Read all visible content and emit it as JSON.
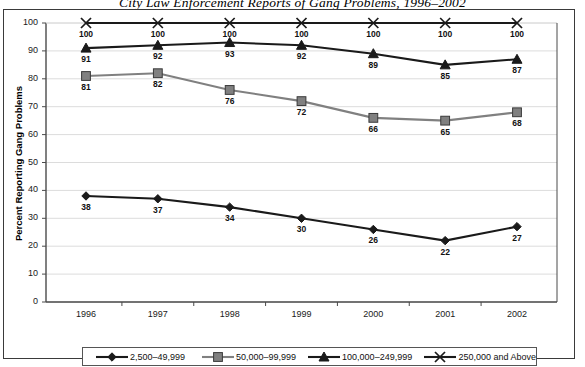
{
  "chart_data": {
    "type": "line",
    "title": "City Law Enforcement Reports of Gang Problems, 1996–2002",
    "xlabel": "",
    "ylabel": "Percent Reporting Gang Problems",
    "categories": [
      "1996",
      "1997",
      "1998",
      "1999",
      "2000",
      "2001",
      "2002"
    ],
    "ylim": [
      0,
      100
    ],
    "ytick_labels": [
      "0",
      "10",
      "20",
      "30",
      "40",
      "50",
      "60",
      "70",
      "80",
      "90",
      "100"
    ],
    "ytick_values": [
      0,
      10,
      20,
      30,
      40,
      50,
      60,
      70,
      80,
      90,
      100
    ],
    "grid": "horizontal",
    "legend_position": "bottom",
    "series": [
      {
        "name": "2,500–49,999",
        "marker": "diamond",
        "color": "#1a1a1a",
        "values": [
          38,
          37,
          34,
          30,
          26,
          22,
          27
        ],
        "labels": [
          "38",
          "37",
          "34",
          "30",
          "26",
          "22",
          "27"
        ]
      },
      {
        "name": "50,000–99,999",
        "marker": "square",
        "color": "#808080",
        "values": [
          81,
          82,
          76,
          72,
          66,
          65,
          68
        ],
        "labels": [
          "81",
          "82",
          "76",
          "72",
          "66",
          "65",
          "68"
        ]
      },
      {
        "name": "100,000–249,999",
        "marker": "triangle",
        "color": "#1a1a1a",
        "values": [
          91,
          92,
          93,
          92,
          89,
          85,
          87
        ],
        "labels": [
          "91",
          "92",
          "93",
          "92",
          "89",
          "85",
          "87"
        ]
      },
      {
        "name": "250,000 and Above",
        "marker": "x",
        "color": "#1a1a1a",
        "values": [
          100,
          100,
          100,
          100,
          100,
          100,
          100
        ],
        "labels": [
          "100",
          "100",
          "100",
          "100",
          "100",
          "100",
          "100"
        ]
      }
    ]
  },
  "colors": {
    "gridline": "#dcdcdc",
    "axis": "#4a4a4a",
    "frame": "#3a3a3a",
    "series_black": "#1a1a1a",
    "series_gray": "#808080",
    "background": "#ffffff"
  }
}
